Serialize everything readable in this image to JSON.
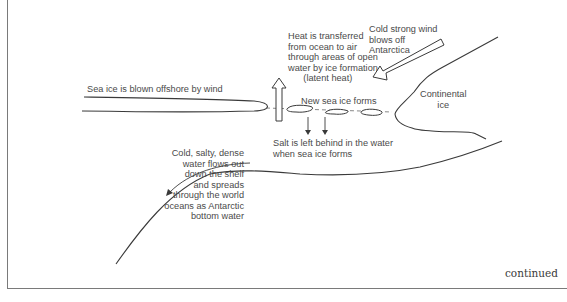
{
  "diagram": {
    "labels": {
      "heat": "Heat is transferred\nfrom ocean to air\nthrough areas of open\nwater by ice formation\n      (latent heat)",
      "wind": "Cold strong wind\nblows off\nAntarctica",
      "sea_ice_blown": "Sea ice is blown offshore by wind",
      "new_sea_ice": "New sea ice forms",
      "continental_ice": "Continental\nice",
      "salt": "Salt is left behind in the water\nwhen sea ice forms",
      "dense_water": "Cold, salty, dense\nwater flows out\ndown the shelf\nand spreads\nthrough the world\noceans as Antarctic\nbottom water"
    },
    "footer": {
      "continued": "continued"
    },
    "icons": {
      "heat_arrow": "up-arrow-outline",
      "wind_arrow": "down-left-arrow-outline",
      "salt_arrows": "down-arrow",
      "flow_arrow": "curved-arrow-down-left"
    },
    "colors": {
      "line": "#3a3a3a",
      "text": "#4a4a4a",
      "border": "#7a7a7a"
    }
  }
}
